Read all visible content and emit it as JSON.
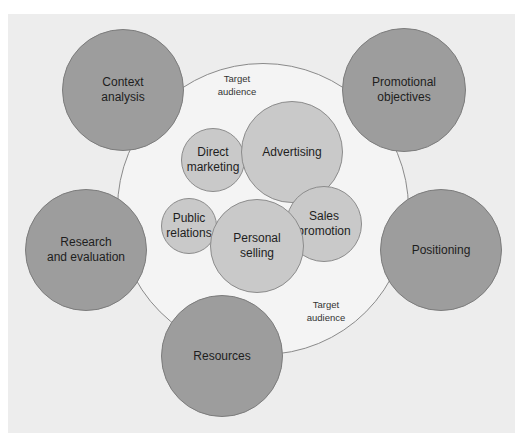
{
  "diagram": {
    "type": "bubble-framework",
    "background_color": "#ededed",
    "outer_region": {
      "label": "Target\naudience",
      "cx": 263,
      "cy": 209,
      "r": 146,
      "fill": "#f4f4f4",
      "label_positions": [
        {
          "text": "Target\naudience",
          "x": 237,
          "y": 75
        },
        {
          "text": "Target\naudience",
          "x": 326,
          "y": 301
        }
      ]
    },
    "elements": [
      {
        "id": "context-analysis",
        "label": "Context\nanalysis",
        "cx": 123,
        "cy": 90,
        "r": 61
      },
      {
        "id": "promotional-objectives",
        "label": "Promotional\nobjectives",
        "cx": 404,
        "cy": 90,
        "r": 62
      },
      {
        "id": "positioning",
        "label": "Positioning",
        "cx": 441,
        "cy": 250,
        "r": 61
      },
      {
        "id": "resources",
        "label": "Resources",
        "cx": 222,
        "cy": 356,
        "r": 61
      },
      {
        "id": "research-and-evaluation",
        "label": "Research\nand evaluation",
        "cx": 86,
        "cy": 250,
        "r": 61
      }
    ],
    "promotional_tools": [
      {
        "id": "direct-marketing",
        "label": "Direct\nmarketing",
        "cx": 213,
        "cy": 160,
        "r": 32
      },
      {
        "id": "advertising",
        "label": "Advertising",
        "cx": 292,
        "cy": 152,
        "r": 51
      },
      {
        "id": "public-relations",
        "label": "Public\nrelations",
        "cx": 189,
        "cy": 226,
        "r": 28
      },
      {
        "id": "personal-selling",
        "label": "Personal\nselling",
        "cx": 257,
        "cy": 246,
        "r": 47
      },
      {
        "id": "sales-promotion",
        "label": "Sales\npromotion",
        "cx": 324,
        "cy": 224,
        "r": 38
      }
    ],
    "colors": {
      "element_fill": "#9d9d9d",
      "tool_fill": "#c9c9c9",
      "outer_fill": "#f4f4f4",
      "stroke": "#808080"
    }
  }
}
